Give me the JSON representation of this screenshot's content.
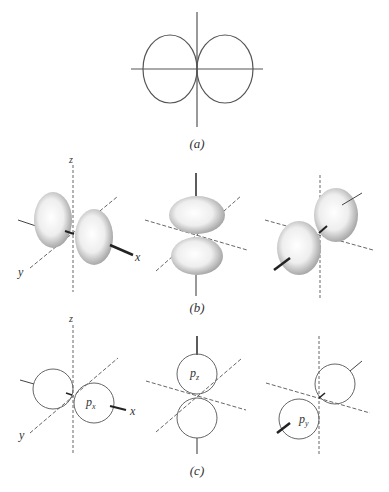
{
  "figure": {
    "panels": [
      {
        "id": "a",
        "caption": "(a)",
        "description": "2D polar plot of p orbital angular function: two tangent lobes along horizontal axis"
      },
      {
        "id": "b",
        "caption": "(b)",
        "description": "Stippled 3D probability surfaces for p orbitals"
      },
      {
        "id": "c",
        "caption": "(c)",
        "description": "Boundary circles for px, pz, py orbitals"
      }
    ],
    "axis_labels": {
      "z": "z",
      "x": "x",
      "y": "y"
    },
    "orbital_labels": {
      "px": "p",
      "px_sub": "x",
      "pz": "p",
      "pz_sub": "z",
      "py": "p",
      "py_sub": "y"
    },
    "colors": {
      "line": "#555555",
      "stipple": "#aaaaaa",
      "background": "#ffffff"
    }
  }
}
